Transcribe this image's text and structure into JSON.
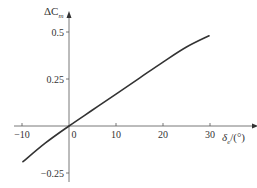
{
  "chart_data": {
    "type": "line",
    "title": "",
    "xlabel": "δ_e/(°)",
    "ylabel": "ΔC_m",
    "xlim": [
      -10,
      32
    ],
    "ylim": [
      -0.3,
      0.55
    ],
    "x_ticks": [
      -10,
      0,
      10,
      20,
      30
    ],
    "x_tick_labels": [
      "−10",
      "0",
      "10",
      "20",
      "30"
    ],
    "y_ticks": [
      0.5,
      0.25,
      -0.25
    ],
    "y_tick_labels": [
      "0.5",
      "0.25",
      "−0.25"
    ],
    "grid": false,
    "legend": null,
    "series": [
      {
        "name": "ΔC_m vs δ_e",
        "color": "#333333",
        "x": [
          -9.8,
          -5,
          0,
          5,
          10,
          15,
          20,
          25,
          29.8
        ],
        "y": [
          -0.19,
          -0.09,
          0.0,
          0.085,
          0.17,
          0.255,
          0.34,
          0.42,
          0.48
        ]
      }
    ]
  },
  "axes": {
    "y_label_main": "ΔC",
    "y_label_sub": "m",
    "x_label_main": "δ",
    "x_label_sub": "e",
    "x_label_unit": "/(°)"
  }
}
